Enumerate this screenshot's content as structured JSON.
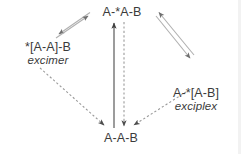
{
  "figure": {
    "type": "state-diagram",
    "background_color": "#ffffff",
    "text_color": "#3b3b3b",
    "solid_arrow_color": "#a8a8a8",
    "dark_arrow_color": "#4a4a4a",
    "dashed_arrow_color": "#8f8f8f"
  },
  "nodes": {
    "top": {
      "formula": "A-*A-B",
      "caption": ""
    },
    "left": {
      "formula": "*[A-A]-B",
      "caption": "excimer"
    },
    "right": {
      "formula": "A-*[A-B]",
      "caption": "exciplex"
    },
    "bottom": {
      "formula": "A-A-B",
      "caption": ""
    }
  },
  "edges": [
    {
      "name": "top-to-left-forward",
      "from": "top",
      "to": "left",
      "style": "solid",
      "color": "#a8a8a8",
      "arrowhead": "to-left"
    },
    {
      "name": "left-to-top-reverse",
      "from": "left",
      "to": "top",
      "style": "solid",
      "color": "#a8a8a8",
      "arrowhead": "to-top"
    },
    {
      "name": "top-to-right-forward",
      "from": "top",
      "to": "right",
      "style": "solid",
      "color": "#a8a8a8",
      "arrowhead": "to-right"
    },
    {
      "name": "right-to-top-reverse",
      "from": "right",
      "to": "top",
      "style": "solid",
      "color": "#a8a8a8",
      "arrowhead": "to-top"
    },
    {
      "name": "bottom-to-top-excitation",
      "from": "bottom",
      "to": "top",
      "style": "solid",
      "color": "#4a4a4a",
      "arrowhead": "to-top"
    },
    {
      "name": "top-to-bottom-decay",
      "from": "top",
      "to": "bottom",
      "style": "dashed",
      "color": "#8f8f8f",
      "arrowhead": "to-bottom"
    },
    {
      "name": "left-to-bottom-decay",
      "from": "left",
      "to": "bottom",
      "style": "dashed",
      "color": "#8f8f8f",
      "arrowhead": "to-bottom"
    },
    {
      "name": "right-to-bottom-decay",
      "from": "right",
      "to": "bottom",
      "style": "dashed",
      "color": "#8f8f8f",
      "arrowhead": "to-bottom"
    }
  ]
}
